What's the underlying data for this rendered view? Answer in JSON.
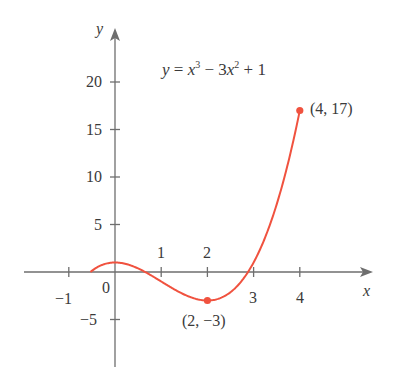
{
  "chart_data": {
    "type": "line",
    "title": "",
    "equation": {
      "lhs": "y",
      "eq": " = ",
      "t1": "x",
      "e1": "3",
      "t2": " − 3",
      "t3": "x",
      "e2": "2",
      "t4": " + 1"
    },
    "function": "y = x^3 - 3x^2 + 1",
    "xlabel": "x",
    "ylabel": "y",
    "xlim": [
      -1.9,
      5.6
    ],
    "ylim": [
      -10,
      26
    ],
    "x_ticks": [
      -1,
      1,
      2,
      3,
      4
    ],
    "x_tick_labels": [
      "−1",
      "1",
      "2",
      "3",
      "4"
    ],
    "y_ticks": [
      -5,
      5,
      10,
      15,
      20
    ],
    "y_tick_labels": [
      "−5",
      "5",
      "10",
      "15",
      "20"
    ],
    "origin_label": "0",
    "domain": [
      -0.532,
      4
    ],
    "series": [
      {
        "name": "y = x^3 - 3x^2 + 1",
        "color": "#f0523f",
        "x_range": [
          -0.532,
          4
        ]
      }
    ],
    "points": [
      {
        "x": 2,
        "y": -3,
        "label": "(2, −3)"
      },
      {
        "x": 4,
        "y": 17,
        "label": "(4, 17)"
      }
    ],
    "grid": false,
    "legend": "none"
  },
  "colors": {
    "axis": "#6e6e6e",
    "curve": "#f0523f",
    "text": "#3a3a3a"
  }
}
